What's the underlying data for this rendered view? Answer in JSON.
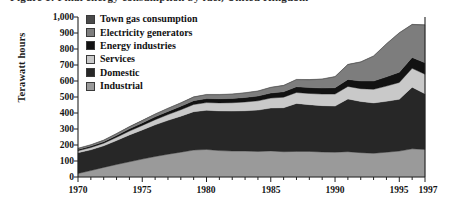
{
  "figure": {
    "clipped_title": "Figure 1: Final energy consumption by fuel, United Kingdom",
    "y_axis_title": "Terawatt hours"
  },
  "legend": {
    "items": [
      {
        "label": "Town gas consumption",
        "color": "#4a4a4a"
      },
      {
        "label": "Electricity generators",
        "color": "#7d7d7d"
      },
      {
        "label": "Energy industries",
        "color": "#121212"
      },
      {
        "label": "Services",
        "color": "#c9c9c9"
      },
      {
        "label": "Domestic",
        "color": "#272727"
      },
      {
        "label": "Industrial",
        "color": "#9a9a9a"
      }
    ]
  },
  "axes": {
    "y_ticks": [
      "1,000",
      "900",
      "800",
      "700",
      "600",
      "500",
      "400",
      "300",
      "200",
      "100",
      "0"
    ],
    "x_ticks": [
      "1970",
      "1975",
      "1980",
      "1985",
      "1990",
      "1995",
      "1997"
    ]
  },
  "chart_data": {
    "type": "area",
    "title": "Final energy consumption by fuel, United Kingdom",
    "xlabel": "",
    "ylabel": "Terawatt hours",
    "ylim": [
      0,
      1000
    ],
    "xlim": [
      1970,
      1997
    ],
    "grid": false,
    "stacked": true,
    "legend_position": "top-left inside plot",
    "x": [
      1970,
      1971,
      1972,
      1973,
      1974,
      1975,
      1976,
      1977,
      1978,
      1979,
      1980,
      1981,
      1982,
      1983,
      1984,
      1985,
      1986,
      1987,
      1988,
      1989,
      1990,
      1991,
      1992,
      1993,
      1994,
      1995,
      1996,
      1997
    ],
    "series": [
      {
        "name": "Industrial",
        "color": "#9a9a9a",
        "values": [
          22,
          40,
          60,
          78,
          95,
          112,
          128,
          142,
          155,
          168,
          172,
          165,
          162,
          162,
          160,
          163,
          158,
          160,
          160,
          156,
          155,
          158,
          152,
          148,
          155,
          162,
          176,
          172
        ]
      },
      {
        "name": "Domestic",
        "color": "#272727",
        "values": [
          130,
          130,
          135,
          150,
          168,
          182,
          198,
          212,
          225,
          240,
          245,
          248,
          250,
          252,
          258,
          268,
          275,
          300,
          292,
          290,
          288,
          330,
          320,
          315,
          318,
          324,
          385,
          348
        ]
      },
      {
        "name": "Services",
        "color": "#c9c9c9",
        "values": [
          12,
          14,
          16,
          20,
          24,
          28,
          32,
          36,
          40,
          45,
          48,
          50,
          52,
          55,
          58,
          62,
          66,
          68,
          70,
          72,
          75,
          78,
          80,
          85,
          95,
          105,
          118,
          122
        ]
      },
      {
        "name": "Energy industries",
        "color": "#121212",
        "values": [
          8,
          9,
          10,
          12,
          14,
          16,
          18,
          20,
          22,
          24,
          25,
          26,
          27,
          28,
          30,
          32,
          34,
          36,
          37,
          38,
          40,
          44,
          48,
          52,
          58,
          64,
          68,
          72
        ]
      },
      {
        "name": "Electricity generators",
        "color": "#7d7d7d",
        "values": [
          6,
          7,
          8,
          10,
          12,
          14,
          16,
          18,
          20,
          22,
          24,
          25,
          26,
          28,
          30,
          34,
          38,
          44,
          48,
          55,
          68,
          92,
          118,
          155,
          205,
          245,
          205,
          235
        ]
      },
      {
        "name": "Town gas consumption",
        "color": "#4a4a4a",
        "values": [
          2,
          2,
          2,
          2,
          2,
          2,
          2,
          2,
          2,
          2,
          2,
          2,
          2,
          2,
          2,
          2,
          2,
          2,
          2,
          2,
          2,
          2,
          2,
          2,
          2,
          2,
          2,
          2
        ]
      }
    ],
    "totals": [
      180,
      202,
      231,
      272,
      315,
      354,
      394,
      430,
      464,
      501,
      516,
      516,
      519,
      527,
      538,
      561,
      573,
      610,
      609,
      613,
      628,
      704,
      720,
      757,
      833,
      902,
      954,
      951
    ]
  },
  "colors": {
    "axis": "#222222",
    "background": "#ffffff",
    "text": "#111111"
  }
}
